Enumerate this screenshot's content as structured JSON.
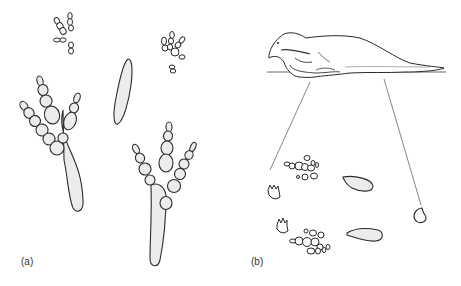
{
  "figure": {
    "panels": [
      {
        "id": "a",
        "label": "(a)",
        "content": [
          "small-footprint-top-left",
          "small-footprint-top-right",
          "tail-drag-mark",
          "large-tridactyl-footprint-left",
          "large-tridactyl-footprint-right"
        ]
      },
      {
        "id": "b",
        "label": "(b)",
        "content": [
          "crouching-dinosaur-silhouette",
          "ground-line",
          "projection-lines",
          "manus-prints",
          "pes-prints",
          "ischial-callosity-marks",
          "tail-tip-mark"
        ]
      }
    ],
    "colors": {
      "outline": "#2a2a2a",
      "fill": "#ececec",
      "guide_line": "#666666",
      "background": "#ffffff"
    }
  }
}
